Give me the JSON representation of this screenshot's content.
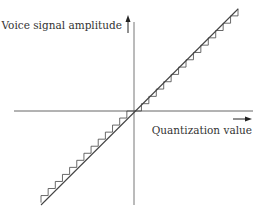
{
  "diagram": {
    "y_axis_label": "Voice signal amplitude",
    "x_axis_label": "Quantization value",
    "y_axis_arrow": "arrow-up",
    "x_axis_arrow": "arrow-right",
    "transfer_line": "linear",
    "quantization_steps_positive": 14,
    "quantization_steps_negative": 13,
    "colors": {
      "line": "#444444",
      "axis": "#666666",
      "text": "#333333",
      "background": "#ffffff"
    }
  }
}
